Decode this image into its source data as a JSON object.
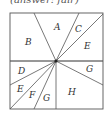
{
  "header": {
    "clipped_text": "(answer: fair)"
  },
  "diagram": {
    "square": {
      "x": 10,
      "y": 13,
      "w": 93,
      "h": 96
    },
    "center": {
      "x": 56,
      "y": 61
    },
    "rays": [
      {
        "x": 34,
        "y": 13
      },
      {
        "x": 79,
        "y": 13
      },
      {
        "x": 103,
        "y": 14
      },
      {
        "x": 103,
        "y": 61
      },
      {
        "x": 103,
        "y": 85
      },
      {
        "x": 56,
        "y": 109
      },
      {
        "x": 34,
        "y": 109
      },
      {
        "x": 10,
        "y": 109
      },
      {
        "x": 10,
        "y": 85
      },
      {
        "x": 10,
        "y": 61
      }
    ],
    "regions": [
      {
        "label": "A",
        "x": 54,
        "y": 30
      },
      {
        "label": "B",
        "x": 25,
        "y": 45
      },
      {
        "label": "C",
        "x": 75,
        "y": 32
      },
      {
        "label": "E",
        "x": 84,
        "y": 49
      },
      {
        "label": "D",
        "x": 18,
        "y": 74
      },
      {
        "label": "G",
        "x": 86,
        "y": 72
      },
      {
        "label": "E",
        "x": 17,
        "y": 92
      },
      {
        "label": "F",
        "x": 29,
        "y": 98
      },
      {
        "label": "G",
        "x": 43,
        "y": 101
      },
      {
        "label": "H",
        "x": 68,
        "y": 95
      }
    ],
    "colors": {
      "line": "#555555",
      "shade": "#bbbbbb"
    }
  }
}
